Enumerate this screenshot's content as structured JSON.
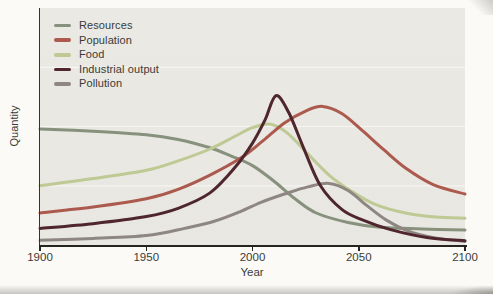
{
  "chart_data": {
    "type": "line",
    "xlabel": "Year",
    "ylabel": "Quantity",
    "x_ticks": [
      "1900",
      "1950",
      "2000",
      "2050",
      "2100"
    ],
    "xlim": [
      1900,
      2100
    ],
    "ylim": [
      0,
      100
    ],
    "grid": "faint horizontal gridlines",
    "gridline_values": [
      25,
      50,
      75
    ],
    "gridline_color": "#f6f5f1",
    "legend_position": "top-left inside plot",
    "plot_background": "#e9e8e3",
    "page_background": "#fbfaf7",
    "axis_color": "#26241f",
    "draw_order": [
      0,
      2,
      4,
      1,
      3
    ],
    "series": [
      {
        "name": "Resources",
        "color": "#87917d",
        "points": [
          [
            1900,
            49
          ],
          [
            1925,
            48
          ],
          [
            1950,
            46.5
          ],
          [
            1965,
            44.5
          ],
          [
            1980,
            41
          ],
          [
            1990,
            37.5
          ],
          [
            2000,
            33.5
          ],
          [
            2010,
            27
          ],
          [
            2020,
            19.5
          ],
          [
            2030,
            13.5
          ],
          [
            2045,
            9.5
          ],
          [
            2060,
            7.5
          ],
          [
            2080,
            6.8
          ],
          [
            2100,
            6.3
          ]
        ]
      },
      {
        "name": "Population",
        "color": "#ac594e",
        "points": [
          [
            1900,
            13.5
          ],
          [
            1925,
            16
          ],
          [
            1950,
            19.5
          ],
          [
            1965,
            23.5
          ],
          [
            1980,
            29.5
          ],
          [
            1995,
            37
          ],
          [
            2005,
            44
          ],
          [
            2015,
            51.5
          ],
          [
            2025,
            56.5
          ],
          [
            2033,
            58.5
          ],
          [
            2042,
            55.5
          ],
          [
            2052,
            48
          ],
          [
            2062,
            40
          ],
          [
            2072,
            32.5
          ],
          [
            2085,
            25.5
          ],
          [
            2100,
            21.5
          ]
        ]
      },
      {
        "name": "Food",
        "color": "#bec994",
        "points": [
          [
            1900,
            25
          ],
          [
            1925,
            28
          ],
          [
            1950,
            31.5
          ],
          [
            1965,
            35.5
          ],
          [
            1980,
            40.5
          ],
          [
            1992,
            46
          ],
          [
            2000,
            49.5
          ],
          [
            2008,
            51
          ],
          [
            2016,
            47.5
          ],
          [
            2026,
            38.5
          ],
          [
            2036,
            29.5
          ],
          [
            2046,
            23
          ],
          [
            2058,
            17
          ],
          [
            2072,
            13.5
          ],
          [
            2086,
            11.8
          ],
          [
            2100,
            11.3
          ]
        ]
      },
      {
        "name": "Industrial output",
        "color": "#4f262d",
        "points": [
          [
            1900,
            7
          ],
          [
            1925,
            9
          ],
          [
            1950,
            12
          ],
          [
            1965,
            15.5
          ],
          [
            1980,
            22
          ],
          [
            1992,
            33
          ],
          [
            2000,
            43
          ],
          [
            2006,
            53
          ],
          [
            2011,
            63
          ],
          [
            2017,
            56
          ],
          [
            2024,
            41
          ],
          [
            2032,
            25
          ],
          [
            2042,
            15
          ],
          [
            2052,
            10.5
          ],
          [
            2065,
            6.5
          ],
          [
            2082,
            3.2
          ],
          [
            2100,
            1.8
          ]
        ]
      },
      {
        "name": "Pollution",
        "color": "#8e8680",
        "points": [
          [
            1900,
            2
          ],
          [
            1925,
            2.8
          ],
          [
            1950,
            4
          ],
          [
            1968,
            7
          ],
          [
            1982,
            10
          ],
          [
            1994,
            14
          ],
          [
            2004,
            18
          ],
          [
            2015,
            21.5
          ],
          [
            2026,
            24.5
          ],
          [
            2036,
            26
          ],
          [
            2045,
            23
          ],
          [
            2054,
            16.5
          ],
          [
            2063,
            10.5
          ],
          [
            2073,
            6
          ],
          [
            2086,
            3
          ],
          [
            2100,
            1.5
          ]
        ]
      }
    ]
  }
}
